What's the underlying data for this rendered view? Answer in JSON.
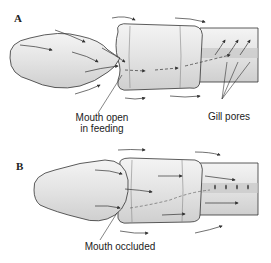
{
  "panels": [
    {
      "label": "A",
      "annotations": {
        "mouth": {
          "line1": "Mouth open",
          "line2": "in feeding"
        },
        "gill": "Gill pores"
      }
    },
    {
      "label": "B",
      "annotations": {
        "mouth": "Mouth occluded"
      }
    }
  ],
  "colors": {
    "body_fill": "#e8e8e8",
    "body_shadow": "#cfcfcf",
    "outline": "#333333",
    "arrow": "#333333"
  }
}
